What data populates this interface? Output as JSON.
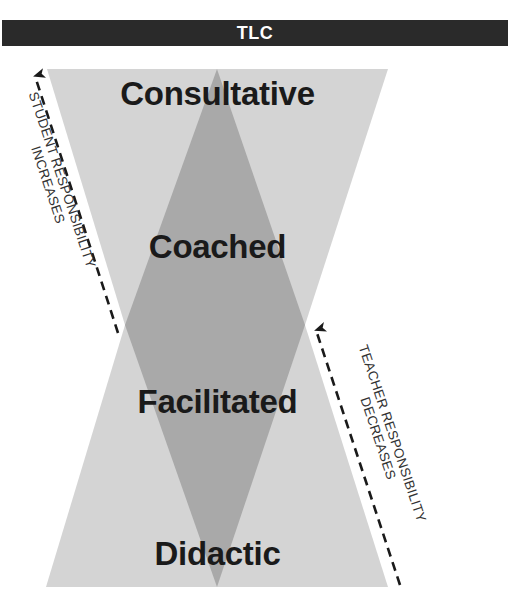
{
  "title": "TLC",
  "levels": [
    {
      "label": "Consultative"
    },
    {
      "label": "Coached"
    },
    {
      "label": "Facilitated"
    },
    {
      "label": "Didactic"
    }
  ],
  "left_arrow": {
    "line1": "STUDENT  RESPONSIBILITY",
    "line2": "INCREASES"
  },
  "right_arrow": {
    "line1": "TEACHER  RESPONSIBILITY",
    "line2": "DECREASES"
  },
  "colors": {
    "title_bar": "#2a2a2a",
    "hourglass_fill": "#d4d4d4",
    "diamond_fill": "#a9a9a9",
    "text": "#1a1a1a"
  }
}
